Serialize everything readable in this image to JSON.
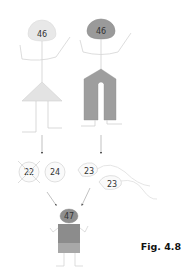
{
  "figure": {
    "label": "Fig. 4.8"
  },
  "parents": {
    "mother": {
      "chromosome_count": "46",
      "head_color": "#e8e8e8",
      "body_color": "#e3e3e3"
    },
    "father": {
      "chromosome_count": "46",
      "head_color": "#9a9a9a",
      "body_color": "#9e9e9e"
    }
  },
  "gametes": {
    "egg_1": {
      "chromosome_count": "22",
      "crossed_out": true
    },
    "egg_2": {
      "chromosome_count": "24"
    },
    "sperm_1": {
      "chromosome_count": "23"
    },
    "sperm_2": {
      "chromosome_count": "23"
    }
  },
  "offspring": {
    "chromosome_count": "47",
    "head_color": "#8f8f8f",
    "shirt_color": "#8c8c8c",
    "shorts_color": "#a8a8a8"
  },
  "colors": {
    "line": "#cfcfcf",
    "arrow": "#555555"
  }
}
